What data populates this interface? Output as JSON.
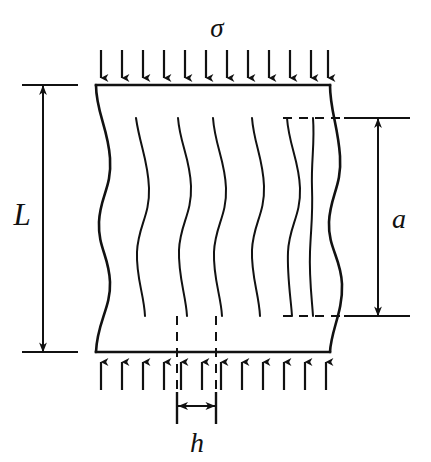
{
  "figure": {
    "background_color": "#ffffff",
    "line_color": "#111111",
    "dash_color": "#111111",
    "width": 431,
    "height": 462
  },
  "labels": {
    "stress": "σ",
    "length": "L",
    "grain_height": "a",
    "grain_width": "h"
  },
  "label_names": {
    "stress": "sigma-stress-label",
    "length": "L-dimension-label",
    "grain_height": "a-dimension-label",
    "grain_width": "h-dimension-label"
  },
  "diagram_data": {
    "type": "engineering-schematic",
    "body": {
      "top_edge_y": 85,
      "bottom_edge_y": 352,
      "left_edge_top_x": 96,
      "left_edge_bottom_x": 96,
      "right_edge_top_x": 330,
      "right_edge_bottom_x": 330,
      "wavy_left": true,
      "wavy_right": true
    },
    "top_arrows": {
      "count": 12,
      "direction": "down",
      "tail_y": 50,
      "tip_y": 83,
      "x_start": 100,
      "x_end": 326
    },
    "bottom_arrows": {
      "count": 12,
      "direction": "up",
      "tail_y": 390,
      "tip_y": 356,
      "x_start": 100,
      "x_end": 326
    },
    "internal_curves": {
      "count": 6,
      "top_y": 118,
      "bottom_y": 316,
      "top_x": [
        136,
        178,
        213,
        252,
        287,
        313
      ]
    },
    "dimension_L": {
      "orientation": "vertical",
      "x": 43,
      "y_top": 85,
      "y_bottom": 352,
      "arrow_heads": "both",
      "extension_line_x_start": 22,
      "extension_line_x_end": 78
    },
    "dimension_a": {
      "orientation": "vertical",
      "x": 378,
      "y_top": 118,
      "y_bottom": 316,
      "arrow_heads": "both",
      "extension_dashed_x_start": 283,
      "extension_solid_x_end": 410
    },
    "dimension_h": {
      "orientation": "horizontal",
      "y": 406,
      "x_left": 177,
      "x_right": 216,
      "arrow_heads": "both",
      "tick_top_y": 386,
      "tick_bottom_y": 426
    },
    "dashed_verticals": {
      "count": 2,
      "x": [
        177,
        216
      ],
      "y_top": 316,
      "y_bottom": 428
    }
  }
}
